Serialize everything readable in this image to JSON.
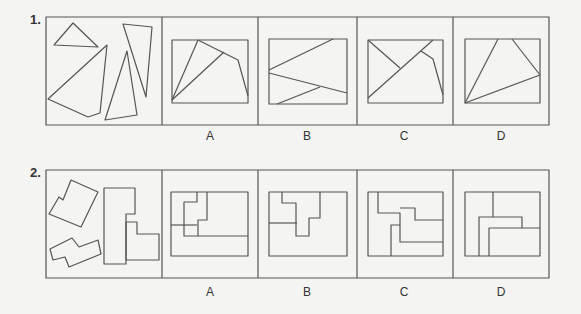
{
  "questions": [
    {
      "number": "1.",
      "options": [
        "A",
        "B",
        "C",
        "D"
      ],
      "prompt_pieces": [
        {
          "shape": "triangle",
          "points": "54,45 73,23 98,47"
        },
        {
          "shape": "quadrilateral",
          "points": "48,99 88,117 100,113 107,45"
        },
        {
          "shape": "triangle",
          "points": "105,120 137,115 127,51"
        },
        {
          "shape": "quadrilateral",
          "points": "123,24 152,27 146,97"
        }
      ],
      "answer_panels": [
        {
          "label": "A",
          "frame": [
            172,
            40,
            248,
            103
          ],
          "lines": [
            "172,100 198,40",
            "172,100 224,52",
            "198,40 238,60 248,96"
          ]
        },
        {
          "label": "B",
          "frame": [
            269,
            39,
            347,
            104
          ],
          "lines": [
            "269,70 333,39",
            "269,73 347,93",
            "277,104 320,87"
          ]
        },
        {
          "label": "C",
          "frame": [
            368,
            40,
            443,
            103
          ],
          "lines": [
            "368,40 400,68",
            "368,98 433,40",
            "421,51 433,59 443,95"
          ]
        },
        {
          "label": "D",
          "frame": [
            465,
            39,
            540,
            103
          ],
          "lines": [
            "465,103 498,39",
            "512,39 540,75",
            "465,103 540,75"
          ]
        }
      ]
    },
    {
      "number": "2.",
      "options": [
        "A",
        "B",
        "C",
        "D"
      ],
      "prompt_pieces": [
        {
          "shape": "L-pentomino",
          "points": "49,214 59,197 63,200 71,180 98,192 81,227"
        },
        {
          "shape": "S-piece",
          "points": "50,249 72,238 79,247 98,240 101,254 69,267 65,257 53,260"
        },
        {
          "shape": "tall-L",
          "points": "104,188 135,188 135,214 126,214 126,264 104,264"
        },
        {
          "shape": "small-L",
          "points": "126,222 137,222 137,234 159,234 159,260 126,260"
        }
      ],
      "answer_panels": [
        {
          "label": "A",
          "frame": [
            171,
            192,
            248,
            256
          ],
          "lines": [
            "171,225 197,225",
            "197,192 197,202 184,202 184,236 248,236",
            "207,192 207,220 198,220 198,236"
          ]
        },
        {
          "label": "B",
          "frame": [
            269,
            192,
            347,
            256
          ],
          "lines": [
            "269,223 297,223",
            "282,192 282,203 296,203 296,236 309,236 309,218 320,218 320,192"
          ]
        },
        {
          "label": "C",
          "frame": [
            368,
            192,
            443,
            256
          ],
          "lines": [
            "378,192 378,213 400,213 400,242 443,242",
            "400,208 415,208 415,220 443,220",
            "400,225 391,225 391,256"
          ]
        },
        {
          "label": "D",
          "frame": [
            465,
            192,
            540,
            256
          ],
          "lines": [
            "493,192 493,217 522,217 522,228",
            "493,217 479,217 479,256",
            "489,256 489,228 540,228"
          ]
        }
      ]
    }
  ],
  "layout": {
    "rows": [
      {
        "top": 17,
        "bottom": 125,
        "label_y": 130,
        "num_y": 12
      },
      {
        "top": 170,
        "bottom": 278,
        "label_y": 290,
        "num_y": 165
      }
    ],
    "left": 46,
    "dividers": [
      162,
      258,
      357,
      453
    ],
    "right": 549,
    "label_x": [
      210,
      307,
      404,
      501
    ]
  },
  "colors": {
    "stroke": "#555555",
    "background": "#f4f4f2",
    "text": "#333333"
  }
}
